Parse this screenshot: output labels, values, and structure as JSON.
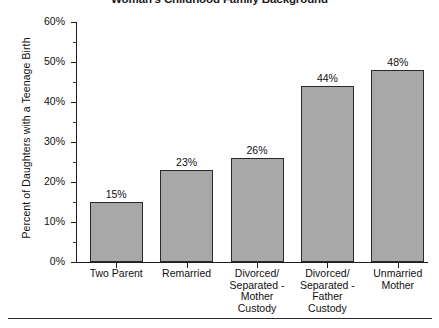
{
  "chart_data": {
    "type": "bar",
    "title": "Woman's Childhood Family Background",
    "xlabel": "",
    "ylabel": "Percent of Daughters with a Teenage Birth",
    "categories": [
      "Two Parent",
      "Divorced/\nSeparated -\nMother\nCustody",
      "Remarried",
      "Divorced/\nSeparated -\nFather\nCustody",
      "Unmarried\nMother"
    ],
    "category_lines": [
      [
        "Two Parent"
      ],
      [
        "Remarried"
      ],
      [
        "Divorced/",
        "Separated -",
        "Mother",
        "Custody"
      ],
      [
        "Divorced/",
        "Separated -",
        "Father",
        "Custody"
      ],
      [
        "Unmarried",
        "Mother"
      ]
    ],
    "values": [
      15,
      23,
      26,
      44,
      48
    ],
    "value_labels": [
      "15%",
      "23%",
      "26%",
      "44%",
      "48%"
    ],
    "ylim": [
      0,
      60
    ],
    "ytick_values": [
      0,
      10,
      20,
      30,
      40,
      50,
      60
    ],
    "ytick_labels": [
      "0%",
      "10%",
      "20%",
      "30%",
      "40%",
      "50%",
      "60%"
    ],
    "yminor_values": [
      5,
      15,
      25,
      35,
      45,
      55
    ],
    "grid": false,
    "legend": null,
    "bar_color": "#a8a8a8",
    "bar_edge_color": "#2a2a2a",
    "axis_color": "#1d1d1d",
    "background": "#ffffff"
  }
}
